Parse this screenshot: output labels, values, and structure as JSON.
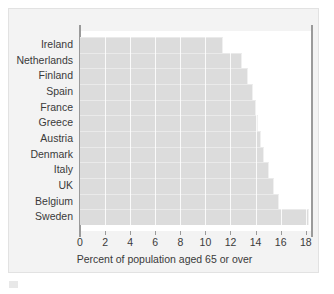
{
  "chart_data": {
    "type": "bar",
    "orientation": "horizontal",
    "title": "",
    "subtitle": "",
    "xlabel": "Percent of population aged 65 or over",
    "ylabel": "",
    "categories": [
      "Ireland",
      "Netherlands",
      "Finland",
      "Spain",
      "France",
      "Greece",
      "Austria",
      "Denmark",
      "Italy",
      "UK",
      "Belgium",
      "Sweden"
    ],
    "values": [
      11.4,
      12.9,
      13.4,
      13.8,
      14.0,
      14.2,
      14.4,
      14.7,
      15.1,
      15.5,
      15.9,
      18.3
    ],
    "xlim": [
      0,
      18.5
    ],
    "xticks": [
      0,
      2,
      4,
      6,
      8,
      10,
      12,
      14,
      16,
      18
    ],
    "xtick_labels": [
      "0",
      "2",
      "4",
      "6",
      "8",
      "10",
      "12",
      "14",
      "16",
      "18"
    ],
    "grid": "vertical",
    "legend": "none",
    "bar_color": "#dcdcdc",
    "plot_background": "#ffffff",
    "figure_background": "#f3f3f3",
    "axis_color": "#9a9a9a",
    "text_color": "#3a3a3a"
  }
}
